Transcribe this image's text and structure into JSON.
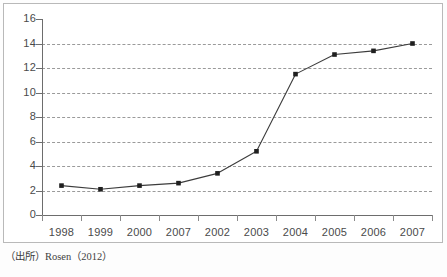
{
  "figure": {
    "source_note": "（出所）Rosen（2012）"
  },
  "chart_data": {
    "type": "line",
    "title": "",
    "xlabel": "",
    "ylabel": "",
    "categories": [
      "1998",
      "1999",
      "2000",
      "2007",
      "2002",
      "2003",
      "2004",
      "2005",
      "2006",
      "2007"
    ],
    "values": [
      2.4,
      2.1,
      2.4,
      2.6,
      3.4,
      5.2,
      11.5,
      13.1,
      13.4,
      14.0
    ],
    "series": [
      {
        "name": "",
        "values": [
          2.4,
          2.1,
          2.4,
          2.6,
          3.4,
          5.2,
          11.5,
          13.1,
          13.4,
          14.0
        ]
      }
    ],
    "ylim": [
      0,
      16
    ],
    "y_ticks": [
      0,
      2,
      4,
      6,
      8,
      10,
      12,
      14,
      16
    ],
    "y_tick_labels": [
      "0",
      "2",
      "4",
      "6",
      "8",
      "10",
      "12",
      "14",
      "16"
    ],
    "gridlines": [
      2,
      4,
      6,
      8,
      10,
      12,
      14
    ],
    "grid": true,
    "grid_style": "dashed-horizontal",
    "legend": "none",
    "marker": "square",
    "colors": {
      "line": "#3c3c3c",
      "marker": "#1f1f1f",
      "grid": "#9a9a9a",
      "axis": "#6d6d6d",
      "frame": "#b9b9b9",
      "text": "#4a4a4a",
      "background": "#ffffff"
    }
  }
}
